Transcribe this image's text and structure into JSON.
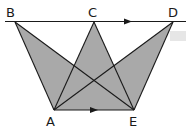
{
  "figure": {
    "points": {
      "B": {
        "label": "B"
      },
      "C": {
        "label": "C"
      },
      "D": {
        "label": "D"
      },
      "A": {
        "label": "A"
      },
      "E": {
        "label": "E"
      }
    },
    "parallel_lines": [
      "BD",
      "AE"
    ],
    "segments": [
      "BA",
      "BE",
      "CA",
      "CE",
      "DA",
      "DE",
      "AE"
    ],
    "shaded_triangles": [
      "ABE",
      "ACE",
      "ADE"
    ],
    "colors": {
      "shade": "#a9a9a9",
      "line": "#1a1a1a",
      "background": "#ffffff"
    }
  }
}
